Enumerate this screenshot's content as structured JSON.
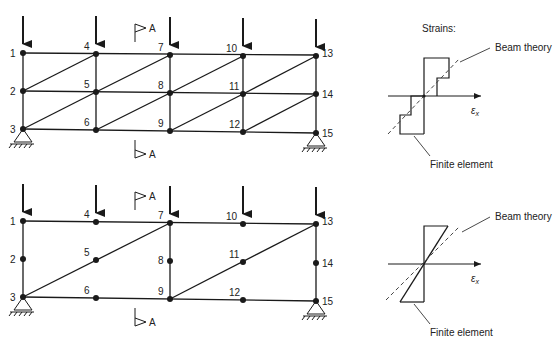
{
  "meshes": [
    {
      "id": "mesh-top",
      "description": "Fine mesh of triangular elements (16 elements)",
      "node_labels": [
        "1",
        "2",
        "3",
        "4",
        "5",
        "6",
        "7",
        "8",
        "9",
        "10",
        "11",
        "12",
        "13",
        "14",
        "15"
      ],
      "section_label": "A",
      "strain_panel": {
        "title": "Strains:",
        "beam_theory_label": "Beam theory",
        "finite_element_label": "Finite element",
        "axis_label": "ε",
        "axis_subscript": "x"
      }
    },
    {
      "id": "mesh-bottom",
      "description": "Coarse mesh of 6-node triangular elements (4 elements)",
      "node_labels": [
        "1",
        "2",
        "3",
        "4",
        "5",
        "6",
        "7",
        "8",
        "9",
        "10",
        "11",
        "12",
        "13",
        "14",
        "15"
      ],
      "section_label": "A",
      "strain_panel": {
        "title": "",
        "beam_theory_label": "Beam theory",
        "finite_element_label": "Finite element",
        "axis_label": "ε",
        "axis_subscript": "x"
      }
    }
  ],
  "colors": {
    "line": "#1a1a1a",
    "text": "#222222",
    "dashed": "#444444"
  }
}
